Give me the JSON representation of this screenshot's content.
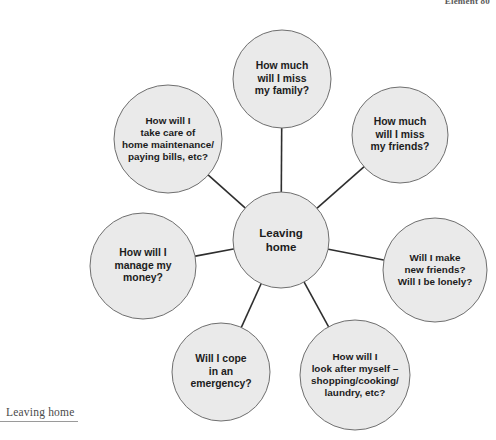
{
  "page": {
    "header_text": "Element 80",
    "footer_caption": "Leaving home"
  },
  "colors": {
    "circle_fill": "#eaeaea",
    "circle_stroke": "#6f6f6f",
    "connector": "#2e2e2e",
    "text": "#1c1c1c",
    "footer_text": "#4a4a4a",
    "rule": "#9a9a9a",
    "background": "#ffffff"
  },
  "diagram": {
    "type": "mind-map",
    "center": {
      "id": "leaving-home",
      "label": "Leaving\nhome",
      "cx": 281,
      "cy": 240,
      "r": 48
    },
    "branches": [
      {
        "id": "miss-family",
        "label": "How much\nwill I miss\nmy family?",
        "cx": 282,
        "cy": 79,
        "r": 49,
        "size": "normal"
      },
      {
        "id": "miss-friends",
        "label": "How much\nwill I miss\nmy friends?",
        "cx": 400,
        "cy": 135,
        "r": 48,
        "size": "normal"
      },
      {
        "id": "new-friends-lonely",
        "label": "Will I make\nnew friends?\nWill I be lonely?",
        "cx": 435,
        "cy": 270,
        "r": 52,
        "size": "tight"
      },
      {
        "id": "look-after-myself",
        "label": "How will I\nlook after myself –\nshopping/cooking/\nlaundry, etc?",
        "cx": 355,
        "cy": 375,
        "r": 55,
        "size": "tight"
      },
      {
        "id": "cope-emergency",
        "label": "Will I cope\nin an\nemergency?",
        "cx": 221,
        "cy": 372,
        "r": 49,
        "size": "normal"
      },
      {
        "id": "manage-money",
        "label": "How will I\nmanage my\nmoney?",
        "cx": 143,
        "cy": 266,
        "r": 53,
        "size": "normal"
      },
      {
        "id": "home-maintenance",
        "label": "How will I\ntake care of\nhome maintenance/\npaying bills, etc?",
        "cx": 168,
        "cy": 139,
        "r": 54,
        "size": "tight"
      }
    ]
  }
}
